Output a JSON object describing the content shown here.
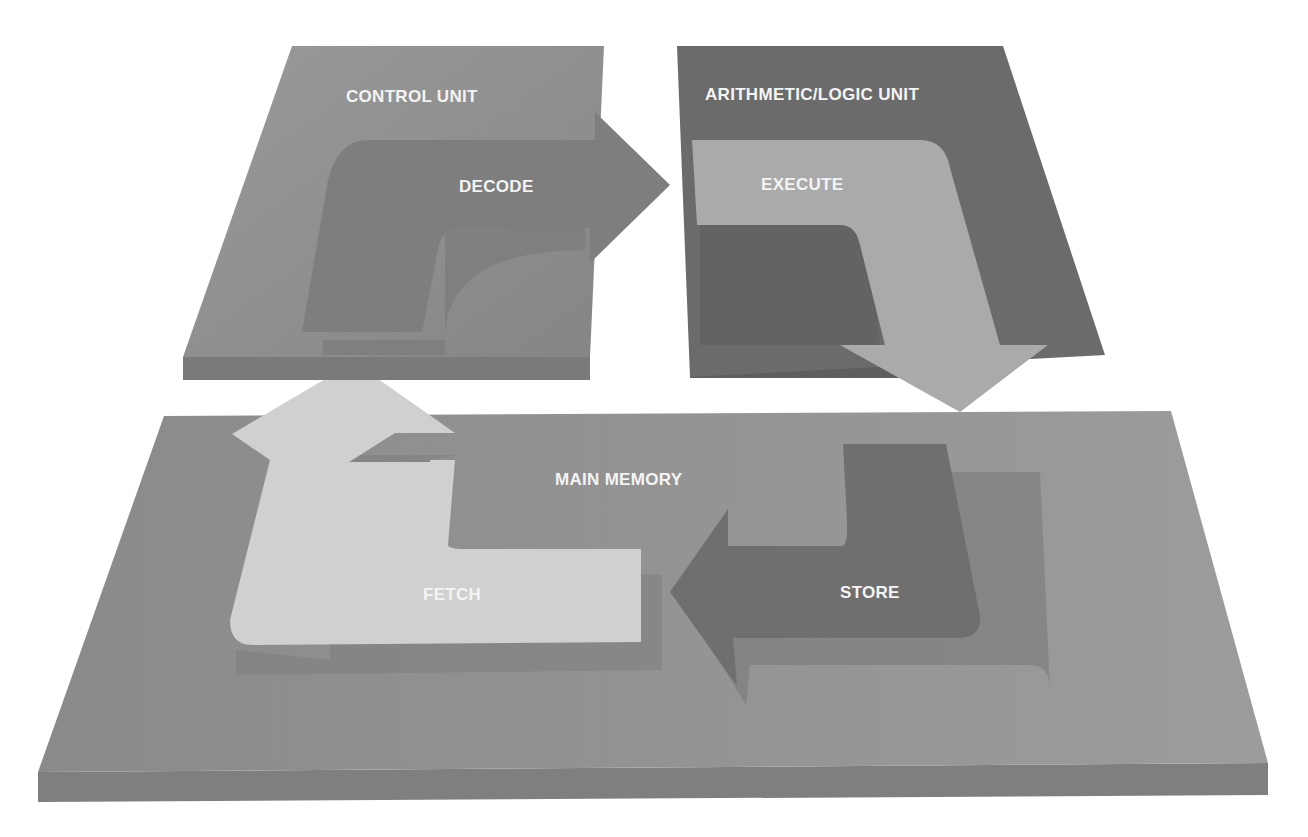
{
  "diagram": {
    "type": "instruction-cycle",
    "components": {
      "control_unit": "CONTROL UNIT",
      "alu": "ARITHMETIC/LOGIC UNIT",
      "main_memory": "MAIN MEMORY"
    },
    "steps": {
      "fetch": "FETCH",
      "decode": "DECODE",
      "execute": "EXECUTE",
      "store": "STORE"
    },
    "flow": [
      "FETCH",
      "DECODE",
      "EXECUTE",
      "STORE"
    ],
    "colors": {
      "control_unit_top": "#8a8a8a",
      "alu_top": "#6b6b6b",
      "memory_top": "#8f8f8f",
      "fetch_arrow": "#cfcfcf",
      "decode_arrow": "#7a7a7a",
      "execute_arrow": "#a9a9a9",
      "store_arrow": "#6f6f6f",
      "label": "#f4f4f4"
    }
  }
}
